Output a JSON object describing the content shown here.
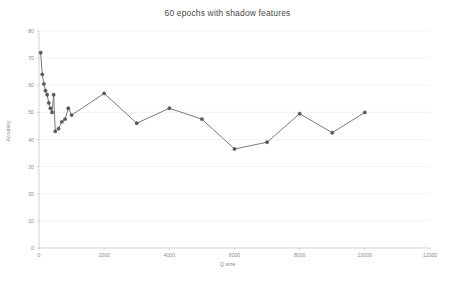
{
  "chart_data": {
    "type": "line",
    "title": "60 epochs with shadow features",
    "xlabel": "Q size",
    "ylabel": "Accuracy",
    "xlim": [
      0,
      12000
    ],
    "ylim": [
      0,
      80
    ],
    "xticks": [
      "0",
      "2000",
      "4000",
      "6000",
      "8000",
      "10000",
      "12000"
    ],
    "xtick_values": [
      0,
      2000,
      4000,
      6000,
      8000,
      10000,
      12000
    ],
    "yticks": [
      "0",
      "10",
      "20",
      "30",
      "40",
      "50",
      "60",
      "70",
      "80"
    ],
    "ytick_values": [
      0,
      10,
      20,
      30,
      40,
      50,
      60,
      70,
      80
    ],
    "grid": "horizontal",
    "legend": "none",
    "line_color": "#6b6b6b",
    "marker_color": "#585858",
    "marker_style": "circle",
    "axis_color": "#c8c8c8",
    "grid_color": "#eeeeee",
    "text_color": "#8c8c8c",
    "title_color": "#4a4a4a",
    "series": [
      {
        "name": "Accuracy",
        "x": [
          50,
          100,
          150,
          200,
          250,
          300,
          350,
          400,
          450,
          500,
          600,
          700,
          800,
          900,
          1000,
          2000,
          3000,
          4000,
          5000,
          6000,
          7000,
          8000,
          9000,
          10000
        ],
        "y": [
          72.0,
          64.0,
          60.5,
          58.0,
          56.5,
          53.5,
          51.5,
          50.0,
          56.5,
          43.0,
          44.0,
          46.5,
          47.5,
          51.5,
          49.0,
          57.0,
          46.0,
          51.5,
          47.5,
          36.5,
          39.0,
          49.5,
          42.5,
          50.0
        ]
      }
    ]
  },
  "layout": {
    "plot_left": 39,
    "plot_right": 430,
    "plot_top": 31,
    "plot_bottom": 248
  }
}
